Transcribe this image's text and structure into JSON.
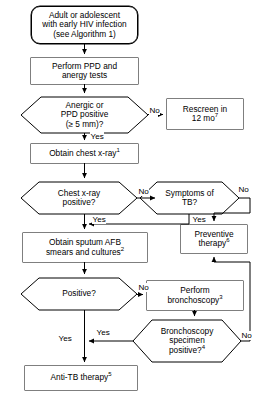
{
  "diagram": {
    "type": "flowchart",
    "orientation": "top-to-bottom",
    "nodes": {
      "start": {
        "shape": "terminator",
        "line1": "Adult or adolescent",
        "line2": "with early HIV infection",
        "line3": "(see Algorithm 1)"
      },
      "ppd_test": {
        "shape": "process",
        "line1": "Perform PPD and",
        "line2": "anergy tests"
      },
      "anergic_decision": {
        "shape": "decision",
        "line1": "Anergic or",
        "line2": "PPD positive",
        "line3": "(≥  5 mm)?"
      },
      "rescreen": {
        "shape": "process",
        "line1": "Rescreen in",
        "line2": "12 mo",
        "sup": "7"
      },
      "chest_xray": {
        "shape": "process",
        "line1": "Obtain chest x-ray",
        "sup": "1"
      },
      "xray_decision": {
        "shape": "decision",
        "line1": "Chest x-ray",
        "line2": "positive?"
      },
      "symptoms_decision": {
        "shape": "decision",
        "line1": "Symptoms of",
        "line2": "TB?"
      },
      "preventive": {
        "shape": "process",
        "line1": "Preventive",
        "line2": "therapy",
        "sup": "6"
      },
      "sputum": {
        "shape": "process",
        "line1": "Obtain sputum AFB",
        "line2": "smears and cultures",
        "sup": "2"
      },
      "positive_decision": {
        "shape": "decision",
        "line1": "Positive?"
      },
      "bronchoscopy": {
        "shape": "process",
        "line1": "Perform",
        "line2": "bronchoscopy",
        "sup": "3"
      },
      "bronch_decision": {
        "shape": "decision",
        "line1": "Bronchoscopy",
        "line2": "specimen",
        "line3": "positive?",
        "sup": "4"
      },
      "antitb": {
        "shape": "process",
        "line1": "Anti-TB therapy",
        "sup": "5"
      }
    },
    "edge_labels": {
      "anergic_no": "No",
      "anergic_yes": "Yes",
      "xray_no": "No",
      "xray_yes": "Yes",
      "symptoms_no": "No",
      "symptoms_yes": "Yes",
      "positive_no": "No",
      "positive_yes": "Yes",
      "bronch_no": "No",
      "bronch_yes": "Yes"
    },
    "colors": {
      "stroke": "#000000",
      "fill": "#ffffff",
      "text": "#000000"
    }
  }
}
